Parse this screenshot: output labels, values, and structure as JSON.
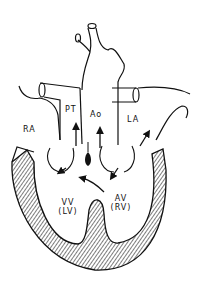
{
  "diagram": {
    "type": "heart anatomy line drawing",
    "labels": {
      "ra": "RA",
      "pt": "PT",
      "ao": "Ao",
      "la": "LA",
      "vv_line1": "VV",
      "vv_line2": "(LV)",
      "av_line1": "AV",
      "av_line2": "(RV)"
    },
    "colors": {
      "stroke": "#111111",
      "background": "#ffffff"
    }
  }
}
